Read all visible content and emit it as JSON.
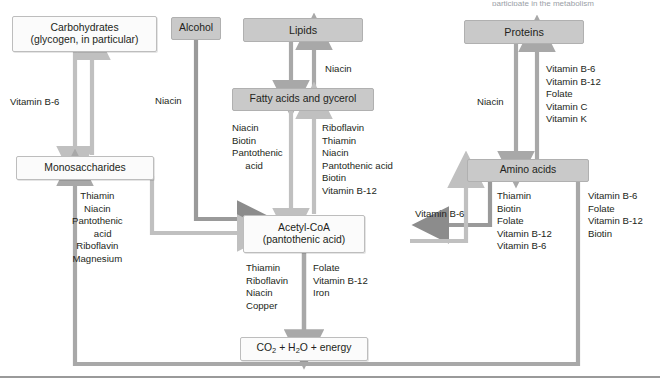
{
  "figure": {
    "title_fragment": "participate in the metabolism",
    "colors": {
      "shaded_box_fill": "#c9c9c9",
      "plain_box_fill": "#fbfbfb",
      "box_border": "#b9b9b9",
      "arrow_light": "#c0c0c0",
      "arrow_mid": "#a8a8a8",
      "arrow_dark": "#8c8c8c",
      "text": "#231f20",
      "rule": "#9a9a9a"
    }
  },
  "nodes": {
    "carbohydrates": {
      "line1": "Carbohydrates",
      "line2": "(glycogen, in particular)"
    },
    "alcohol": {
      "label": "Alcohol"
    },
    "lipids": {
      "label": "Lipids"
    },
    "proteins": {
      "label": "Proteins"
    },
    "fatty_acids": {
      "label": "Fatty acids and gycerol"
    },
    "monosaccharides": {
      "label": "Monosaccharides"
    },
    "amino_acids": {
      "label": "Amino acids"
    },
    "acetyl_coa": {
      "line1": "Acetyl-CoA",
      "line2": "(pantothenic acid)"
    },
    "end_products": {
      "label": "CO2 + H2O + energy",
      "part1": "CO",
      "sub1": "2",
      "part2": " + H",
      "sub2": "2",
      "part3": "O + energy"
    }
  },
  "labels": {
    "carbs_to_mono": "Vitamin B-6",
    "alcohol_to_acetyl": "Niacin",
    "fatty_to_lipids": "Niacin",
    "proteins_to_amino": "Niacin",
    "acetyl_to_fatty_right": "Vitamin B-6",
    "mono_to_acetyl": "Thiamin\nNiacin\nPantothenic\n    acid\nRiboflavin\nMagnesium",
    "lipids_down_list": "Niacin\nBiotin\nPantothenic\n     acid",
    "fatty_up_list": "Riboflavin\nThiamin\nNiacin\nPantothenic acid\nBiotin\nVitamin B-12",
    "amino_to_proteins": "Vitamin B-6\nVitamin B-12\nFolate\nVitamin C\nVitamin K",
    "amino_to_acetyl": "Thiamin\nBiotin\nFolate\nVitamin B-12\nVitamin B-6",
    "acetyl_to_amino": "Vitamin B-6\nFolate\nVitamin B-12\nBiotin",
    "acetyl_down_left": "Thiamin\nRiboflavin\nNiacin\nCopper",
    "acetyl_down_right": "Folate\nVitamin B-12\nIron"
  }
}
